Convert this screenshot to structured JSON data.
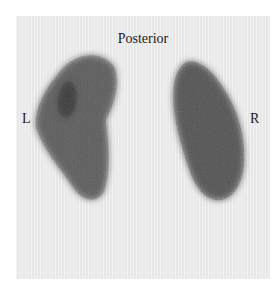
{
  "view_label": "Posterior",
  "left_marker": "L",
  "right_marker": "R",
  "colors": {
    "background": "#ececec",
    "uptake": "#3a3a3a",
    "text": "#1a1a1a"
  }
}
